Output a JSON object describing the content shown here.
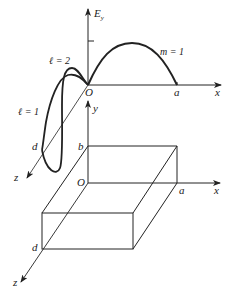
{
  "upper_plot": {
    "vertical_axis_label": "E",
    "vertical_axis_subscript": "y",
    "origin_label": "O",
    "x_axis_label": "x",
    "x_end_label": "a",
    "z_axis_label": "z",
    "z_end_label": "d",
    "mode_x_label": "m = 1",
    "mode_z_labels": [
      "ℓ = 2",
      "ℓ = 1"
    ]
  },
  "lower_plot": {
    "y_axis_label": "y",
    "y_end_label": "b",
    "origin_label": "O",
    "x_axis_label": "x",
    "x_end_label": "a",
    "z_axis_label": "z",
    "z_end_label": "d"
  },
  "colors": {
    "ink": "#222222",
    "background": "#ffffff"
  }
}
